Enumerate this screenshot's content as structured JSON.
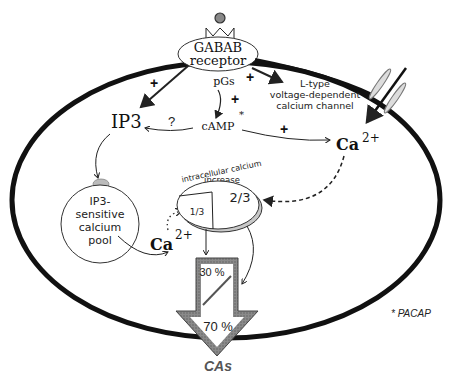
{
  "diagram": {
    "receptor": {
      "line1": "GABAB",
      "line2": "receptor"
    },
    "pgs": "pGs",
    "camp": "cAMP",
    "camp_star": "*",
    "ip3": "IP3",
    "question": "?",
    "plus": "+",
    "l_type": {
      "line1": "L-type",
      "line2": "voltage-dependent",
      "line3": "calcium channel"
    },
    "ca_right": {
      "base": "Ca",
      "sup": "2+"
    },
    "ca_left": {
      "base": "Ca",
      "sup": "2+"
    },
    "pool": {
      "line1": "IP3-",
      "line2": "sensitive",
      "line3": "calcium",
      "line4": "pool"
    },
    "increase": {
      "line1": "intracellular calcium",
      "line2": "increase"
    },
    "fraction_big": "2/3",
    "fraction_small": "1/3",
    "arrow_top_pct": "30 %",
    "arrow_bottom_pct": "70 %",
    "output": "CAs",
    "footnote": "* PACAP"
  }
}
